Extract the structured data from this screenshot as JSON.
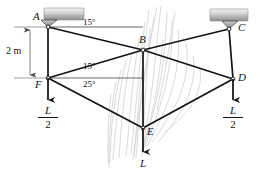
{
  "figure": {
    "kind": "statics-truss-free-body-diagram",
    "nodes": [
      {
        "id": "A",
        "label": "A",
        "x": 48,
        "y": 27
      },
      {
        "id": "B",
        "label": "B",
        "x": 143,
        "y": 50
      },
      {
        "id": "C",
        "label": "C",
        "x": 236,
        "y": 29
      },
      {
        "id": "D",
        "label": "D",
        "x": 233,
        "y": 79
      },
      {
        "id": "E",
        "label": "E",
        "x": 143,
        "y": 128
      },
      {
        "id": "F",
        "label": "F",
        "x": 48,
        "y": 78
      }
    ],
    "members": [
      {
        "from": "A",
        "to": "B"
      },
      {
        "from": "B",
        "to": "C"
      },
      {
        "from": "A",
        "to": "F"
      },
      {
        "from": "C",
        "to": "D"
      },
      {
        "from": "F",
        "to": "B"
      },
      {
        "from": "B",
        "to": "D"
      },
      {
        "from": "F",
        "to": "E"
      },
      {
        "from": "E",
        "to": "D"
      },
      {
        "from": "B",
        "to": "E"
      }
    ],
    "supports": [
      {
        "at": "A",
        "type": "pin"
      },
      {
        "at": "C",
        "type": "pin"
      }
    ],
    "angles": [
      {
        "id": "angle-ab",
        "value": "15°",
        "x": 96,
        "y": 27
      },
      {
        "id": "angle-fb",
        "value": "15°",
        "x": 96,
        "y": 68
      },
      {
        "id": "angle-fe",
        "value": "25°",
        "x": 96,
        "y": 84
      }
    ],
    "dimension": {
      "label": "2 m",
      "from": "A",
      "to": "F",
      "x": 10,
      "y": 46
    },
    "loads": [
      {
        "id": "load-F",
        "at": "F",
        "numerator": "L",
        "denominator": "2",
        "x": 48,
        "y": 112
      },
      {
        "id": "load-E",
        "at": "E",
        "numerator": "L",
        "denominator": "",
        "x": 143,
        "y": 164
      },
      {
        "id": "load-D",
        "at": "D",
        "numerator": "L",
        "denominator": "2",
        "x": 233,
        "y": 112
      }
    ],
    "colors": {
      "line": "#141414",
      "text": "#141414",
      "support_light": "#e4e4e4",
      "support_dark": "#9c9c9c",
      "artifact": "#c9c9c9"
    }
  }
}
